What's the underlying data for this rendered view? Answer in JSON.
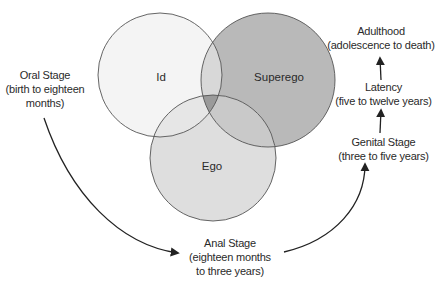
{
  "colors": {
    "id_fill": "#f4f4f4",
    "superego_fill": "#b9b9b9",
    "ego_fill": "#dedede",
    "id_superego_overlap": "#d8d8d8",
    "id_ego_overlap": "#e6e6e6",
    "superego_ego_overlap": "#c9c9c9",
    "center_overlap": "#9a9a9a",
    "stroke": "#555555",
    "arrow": "#222222",
    "text": "#2a2a2a"
  },
  "circles": {
    "id": {
      "label": "Id",
      "cx": 160,
      "cy": 75,
      "r": 62
    },
    "superego": {
      "label": "Superego",
      "cx": 268,
      "cy": 80,
      "r": 67
    },
    "ego": {
      "label": "Ego",
      "cx": 213,
      "cy": 158,
      "r": 63
    }
  },
  "stages": {
    "oral": {
      "name": "Oral Stage",
      "line2": "(birth to eighteen",
      "line3": "months)"
    },
    "anal": {
      "name": "Anal Stage",
      "line2": "(eighteen months",
      "line3": "to three years)"
    },
    "genital": {
      "name": "Genital Stage",
      "line2": "(three to five years)"
    },
    "latency": {
      "name": "Latency",
      "line2": "(five to twelve years)"
    },
    "adulthood": {
      "name": "Adulthood",
      "line2": "(adolescence to death)"
    }
  }
}
